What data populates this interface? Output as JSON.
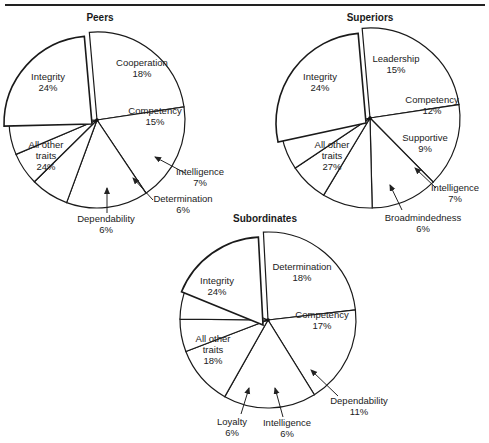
{
  "chart_data": [
    {
      "type": "pie",
      "title": "Peers",
      "slices": [
        {
          "label": "Integrity",
          "value": 24
        },
        {
          "label": "Cooperation",
          "value": 18
        },
        {
          "label": "Competency",
          "value": 15
        },
        {
          "label": "Intelligence",
          "value": 7
        },
        {
          "label": "Determination",
          "value": 6
        },
        {
          "label": "Dependability",
          "value": 6
        },
        {
          "label": "All other traits",
          "value": 24,
          "exploded": true
        }
      ]
    },
    {
      "type": "pie",
      "title": "Superiors",
      "slices": [
        {
          "label": "Integrity",
          "value": 24
        },
        {
          "label": "Leadership",
          "value": 15
        },
        {
          "label": "Competency",
          "value": 12
        },
        {
          "label": "Supportive",
          "value": 9
        },
        {
          "label": "Intelligence",
          "value": 7
        },
        {
          "label": "Broadmindedness",
          "value": 6
        },
        {
          "label": "All other traits",
          "value": 27,
          "exploded": true
        }
      ]
    },
    {
      "type": "pie",
      "title": "Subordinates",
      "slices": [
        {
          "label": "Integrity",
          "value": 24
        },
        {
          "label": "Determination",
          "value": 18
        },
        {
          "label": "Competency",
          "value": 17
        },
        {
          "label": "Dependability",
          "value": 11
        },
        {
          "label": "Intelligence",
          "value": 6
        },
        {
          "label": "Loyalty",
          "value": 6
        },
        {
          "label": "All other traits",
          "value": 18,
          "exploded": true
        }
      ]
    }
  ],
  "titles": {
    "peers": "Peers",
    "superiors": "Superiors",
    "subordinates": "Subordinates"
  }
}
